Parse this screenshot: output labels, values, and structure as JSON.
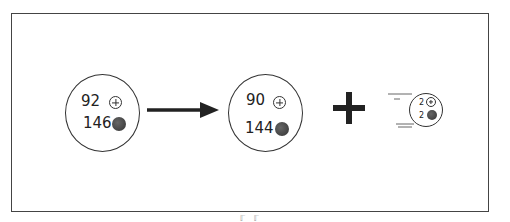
{
  "diagram": {
    "parent": {
      "protons": "92",
      "neutrons": "146"
    },
    "daughter": {
      "protons": "90",
      "neutrons": "144"
    },
    "alpha": {
      "protons": "2",
      "neutrons": "2"
    },
    "operator": "+",
    "arrow": "→",
    "caption_fragment": "ℾ ℾ"
  }
}
